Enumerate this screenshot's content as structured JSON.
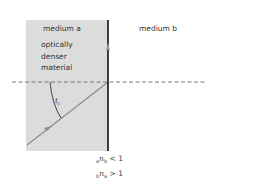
{
  "diagram": {
    "labels": {
      "medium_a": "medium a",
      "medium_a_desc": [
        "optically",
        "denser",
        "material"
      ],
      "medium_b": "medium b",
      "angle_symbol": "i",
      "angle_subscript": "c"
    },
    "equations": [
      {
        "pre_sub": "a",
        "symbol": "n",
        "post_sub": "b",
        "relation": "< 1"
      },
      {
        "pre_sub": "b",
        "symbol": "n",
        "post_sub": "a",
        "relation": "> 1"
      }
    ],
    "colors": {
      "medium_a_fill": "#dcdcdc",
      "boundary": "#111111",
      "ray": "#8a8a8a",
      "normal_dashed": "#777777"
    }
  }
}
